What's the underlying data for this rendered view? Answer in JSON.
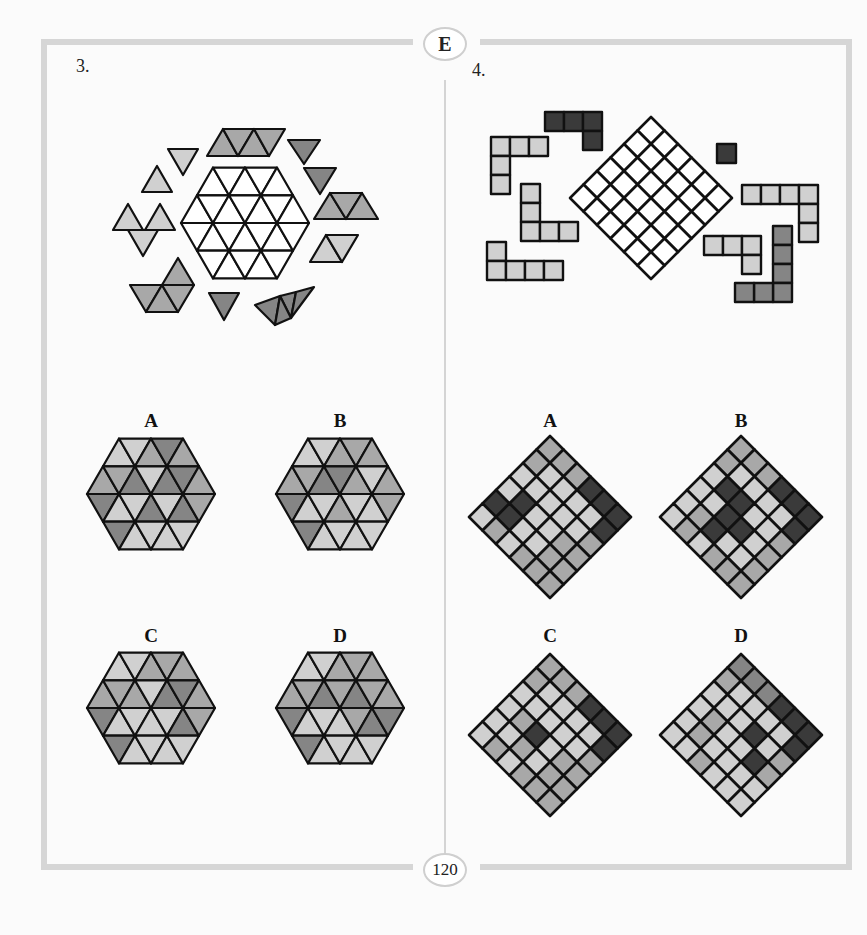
{
  "page": {
    "section_badge": "E",
    "page_number": "120"
  },
  "colors": {
    "white": "#ffffff",
    "light": "#d0d0d0",
    "mid": "#a8a8a8",
    "dark": "#858585",
    "black": "#3a3a3a",
    "stroke": "#111111",
    "frame": "#d6d6d6"
  },
  "puzzle3": {
    "number": "3.",
    "description": "Hexagon of 24 triangles to be filled with surrounding triangle pieces",
    "options": [
      {
        "label": "A"
      },
      {
        "label": "B"
      },
      {
        "label": "C"
      },
      {
        "label": "D"
      }
    ]
  },
  "puzzle4": {
    "number": "4.",
    "description": "6x6 diamond grid to be filled with surrounding polyomino pieces",
    "options": [
      {
        "label": "A"
      },
      {
        "label": "B"
      },
      {
        "label": "C"
      },
      {
        "label": "D"
      }
    ]
  }
}
